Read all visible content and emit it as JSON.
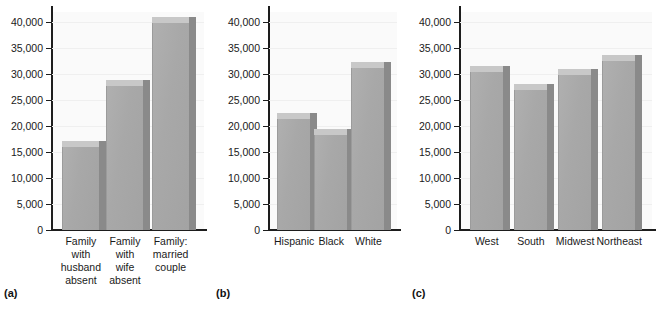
{
  "chart_data": [
    {
      "type": "bar",
      "panel": "(a)",
      "title": "",
      "xlabel": "",
      "ylabel": "",
      "ylim": [
        0,
        42000
      ],
      "yticks": [
        0,
        5000,
        10000,
        15000,
        20000,
        25000,
        30000,
        35000,
        40000
      ],
      "ytick_labels": [
        "0",
        "5,000",
        "10,000",
        "15,000",
        "20,000",
        "25,000",
        "30,000",
        "35,000",
        "40,000"
      ],
      "grid": true,
      "legend": "none",
      "categories": [
        "Family\nwith\nhusband\nabsent",
        "Family\nwith\nwife\nabsent",
        "Family:\nmarried\ncouple"
      ],
      "values": [
        16000,
        27800,
        39800
      ]
    },
    {
      "type": "bar",
      "panel": "(b)",
      "title": "",
      "xlabel": "",
      "ylabel": "",
      "ylim": [
        0,
        42000
      ],
      "yticks": [
        0,
        5000,
        10000,
        15000,
        20000,
        25000,
        30000,
        35000,
        40000
      ],
      "ytick_labels": [
        "0",
        "5,000",
        "10,000",
        "15,000",
        "20,000",
        "25,000",
        "30,000",
        "35,000",
        "40,000"
      ],
      "grid": true,
      "legend": "none",
      "categories": [
        "Hispanic",
        "Black",
        "White"
      ],
      "values": [
        21400,
        18400,
        31200
      ]
    },
    {
      "type": "bar",
      "panel": "(c)",
      "title": "",
      "xlabel": "",
      "ylabel": "",
      "ylim": [
        0,
        42000
      ],
      "yticks": [
        0,
        5000,
        10000,
        15000,
        20000,
        25000,
        30000,
        35000,
        40000
      ],
      "ytick_labels": [
        "0",
        "5,000",
        "10,000",
        "15,000",
        "20,000",
        "25,000",
        "30,000",
        "35,000",
        "40,000"
      ],
      "grid": true,
      "legend": "none",
      "categories": [
        "West",
        "South",
        "Midwest",
        "Northeast"
      ],
      "values": [
        30500,
        27000,
        29800,
        32500
      ]
    }
  ],
  "panels": [
    {
      "letter": "(a)",
      "yticks": [
        "40,000",
        "35,000",
        "30,000",
        "25,000",
        "20,000",
        "15,000",
        "10,000",
        "5,000",
        "0"
      ],
      "bars": [
        {
          "label": "Family\nwith\nhusband\nabsent",
          "value": 16000
        },
        {
          "label": "Family\nwith\nwife\nabsent",
          "value": 27800
        },
        {
          "label": "Family:\nmarried\ncouple",
          "value": 39800
        }
      ]
    },
    {
      "letter": "(b)",
      "yticks": [
        "40,000",
        "35,000",
        "30,000",
        "25,000",
        "20,000",
        "15,000",
        "10,000",
        "5,000",
        "0"
      ],
      "bars": [
        {
          "label": "Hispanic",
          "value": 21400
        },
        {
          "label": "Black",
          "value": 18400
        },
        {
          "label": "White",
          "value": 31200
        }
      ]
    },
    {
      "letter": "(c)",
      "yticks": [
        "40,000",
        "35,000",
        "30,000",
        "25,000",
        "20,000",
        "15,000",
        "10,000",
        "5,000",
        "0"
      ],
      "bars": [
        {
          "label": "West",
          "value": 30500
        },
        {
          "label": "South",
          "value": 27000
        },
        {
          "label": "Midwest",
          "value": 29800
        },
        {
          "label": "Northeast",
          "value": 32500
        }
      ]
    }
  ],
  "style": {
    "bar_front_color": "#a8a8a8",
    "bar_top_color": "#c8c8c8",
    "bar_side_color": "#8a8a8a",
    "axis_color": "#1d1d1d",
    "grid_color": "#efefef",
    "plot_background": "#fafafa",
    "page_background": "#ffffff"
  }
}
